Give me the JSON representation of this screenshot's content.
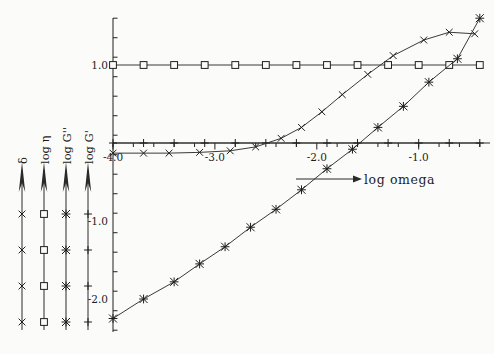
{
  "figure": {
    "background": "#fbfbf9",
    "ink": "#1f1f1f"
  },
  "chart_data": {
    "type": "line",
    "title": "",
    "subtitle": "",
    "xlabel": "log omega",
    "ylabel": "",
    "xlim": [
      -4.0,
      -0.3
    ],
    "ylim": [
      -2.35,
      1.75
    ],
    "grid": false,
    "legend_position": "left-vertical-axes",
    "x_ticks_major": [
      -4.0,
      -3.0,
      -2.0,
      -1.0
    ],
    "x_tick_labels": [
      "-4.0",
      "-3.0",
      "-2.0",
      "-1.0"
    ],
    "x_minor_step": 0.2,
    "y_ticks_major": [
      1.0,
      -1.0,
      -2.0
    ],
    "y_tick_labels": [
      "1.0",
      "-1.0",
      "-2.0"
    ],
    "y_minor_step": 0.25,
    "annotations": [
      {
        "text": "log omega",
        "kind": "x-axis-arrow-label"
      }
    ],
    "series": [
      {
        "name": "log eta",
        "label": "log η",
        "marker": "square",
        "marker_symbol": "□",
        "x": [
          -4.0,
          -3.7,
          -3.4,
          -3.1,
          -2.8,
          -2.5,
          -2.2,
          -1.9,
          -1.6,
          -1.3,
          -1.0,
          -0.7,
          -0.4
        ],
        "y": [
          1.0,
          1.0,
          1.0,
          1.0,
          1.0,
          1.0,
          1.0,
          1.0,
          1.0,
          1.0,
          1.0,
          1.0,
          1.0
        ]
      },
      {
        "name": "log G prime",
        "label": "log G'",
        "marker": "plus",
        "marker_symbol": "+",
        "x": [
          -4.0,
          -3.7,
          -3.4,
          -3.1,
          -2.8,
          -2.5,
          -2.2,
          -1.9,
          -1.6,
          -1.3,
          -1.0,
          -0.7,
          -0.4
        ],
        "y": [
          0.0,
          0.0,
          0.0,
          0.0,
          0.0,
          0.0,
          0.0,
          0.0,
          0.0,
          0.0,
          0.0,
          0.0,
          0.0
        ]
      },
      {
        "name": "delta",
        "label": "δ",
        "marker": "cross",
        "marker_symbol": "×",
        "x": [
          -4.0,
          -3.7,
          -3.45,
          -3.15,
          -2.85,
          -2.6,
          -2.35,
          -2.15,
          -1.95,
          -1.75,
          -1.5,
          -1.25,
          -0.95,
          -0.7,
          -0.45
        ],
        "y": [
          -0.13,
          -0.13,
          -0.13,
          -0.12,
          -0.1,
          -0.05,
          0.06,
          0.2,
          0.4,
          0.62,
          0.88,
          1.12,
          1.32,
          1.42,
          1.4
        ]
      },
      {
        "name": "log G double prime",
        "label": "log G''",
        "marker": "star",
        "marker_symbol": "✻",
        "x": [
          -4.0,
          -3.7,
          -3.4,
          -3.15,
          -2.9,
          -2.65,
          -2.4,
          -2.15,
          -1.9,
          -1.65,
          -1.4,
          -1.15,
          -0.9,
          -0.62,
          -0.4
        ],
        "y": [
          -2.25,
          -2.0,
          -1.78,
          -1.55,
          -1.33,
          -1.08,
          -0.85,
          -0.6,
          -0.33,
          -0.08,
          0.2,
          0.47,
          0.78,
          1.08,
          1.6
        ]
      }
    ]
  },
  "legend_axes": [
    {
      "id": "delta",
      "label": "δ",
      "marker_symbol": "×",
      "marker": "cross",
      "x": 22
    },
    {
      "id": "log-eta",
      "label": "log η",
      "marker_symbol": "□",
      "marker": "square",
      "x": 44
    },
    {
      "id": "log-g-double-prime",
      "label": "log G''",
      "marker_symbol": "✻",
      "marker": "star",
      "x": 66
    },
    {
      "id": "log-g-prime",
      "label": "log G'",
      "marker_symbol": "+",
      "marker": "plus",
      "x": 88
    }
  ],
  "axis_labels": {
    "x_axis_arrow_text": "log omega",
    "y_tick_1": "1.0",
    "y_tick_2": "-1.0",
    "y_tick_3": "-2.0",
    "x_tick_1": "-4.0",
    "x_tick_2": "-3.0",
    "x_tick_3": "-2.0",
    "x_tick_4": "-1.0"
  }
}
